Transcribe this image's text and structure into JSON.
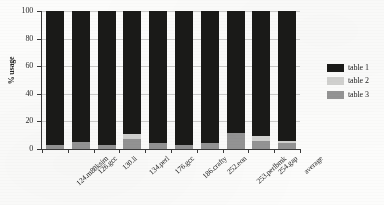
{
  "chart_data": {
    "type": "bar",
    "subtype": "stacked-bar",
    "title": "",
    "xlabel": "",
    "ylabel": "% usage",
    "ylim": [
      0,
      100
    ],
    "yticks": [
      0,
      20,
      40,
      60,
      80,
      100
    ],
    "grid": true,
    "legend_position": "right",
    "stack_order_bottom_to_top": [
      "table 3",
      "table 2",
      "table 1"
    ],
    "categories": [
      "124.m88ksim",
      "126.gcc",
      "130.li",
      "134.perl",
      "176.gcc",
      "186.crafty",
      "252.eon",
      "253.perlbmk",
      "254.gap",
      "average"
    ],
    "series": [
      {
        "name": "table 1",
        "color": "#1a1a18",
        "values": [
          97.0,
          95.0,
          97.0,
          89.0,
          96.0,
          97.0,
          96.0,
          88.5,
          90.5,
          94.0
        ]
      },
      {
        "name": "table 2",
        "color": "#d2d2d0",
        "values": [
          0.0,
          0.0,
          0.0,
          4.0,
          0.0,
          0.0,
          0.0,
          0.0,
          4.0,
          1.5
        ]
      },
      {
        "name": "table 3",
        "color": "#949494",
        "values": [
          3.0,
          5.0,
          3.0,
          7.0,
          4.0,
          3.0,
          4.0,
          11.5,
          5.5,
          4.5
        ]
      }
    ]
  },
  "legend": {
    "items": [
      {
        "label": "table 1",
        "color": "#1a1a18"
      },
      {
        "label": "table 2",
        "color": "#d2d2d0"
      },
      {
        "label": "table 3",
        "color": "#949494"
      }
    ]
  },
  "axes": {
    "y_title": "% usage",
    "y_tick_labels": [
      "0",
      "20",
      "40",
      "60",
      "80",
      "100"
    ]
  }
}
